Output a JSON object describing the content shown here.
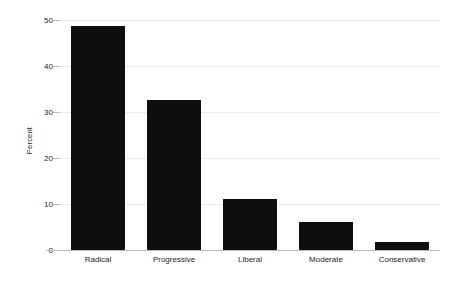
{
  "chart_data": {
    "type": "bar",
    "title": "",
    "subtitle": "",
    "xlabel": "",
    "ylabel": "Percent",
    "categories": [
      "Radical",
      "Progressive",
      "Liberal",
      "Moderate",
      "Conservative"
    ],
    "values": [
      48.8,
      32.7,
      11.0,
      6.1,
      1.8
    ],
    "series": [
      {
        "name": "Percent",
        "values": [
          48.8,
          32.7,
          11.0,
          6.1,
          1.8
        ]
      }
    ],
    "ylim": [
      0,
      50
    ],
    "xlim_categories": 5,
    "y_ticks": [
      0,
      10,
      20,
      30,
      40,
      50
    ],
    "y_tick_labels": [
      "0",
      "10",
      "20",
      "30",
      "40",
      "50"
    ],
    "grid": "horizontal",
    "legend": "none",
    "bar_color": "#0d0d0d",
    "grid_color": "#ececec",
    "axis_color": "#bdbdbd",
    "text_color": "#231f20",
    "background_color": "#ffffff"
  }
}
